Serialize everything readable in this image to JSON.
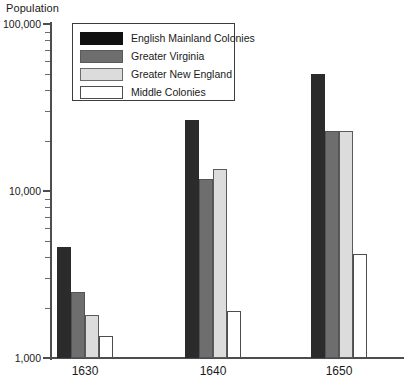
{
  "chart_data": {
    "type": "bar",
    "title": "",
    "xlabel": "",
    "ylabel": "Population",
    "yscale": "log",
    "ylim": [
      1000,
      100000
    ],
    "ytick_labels": [
      "100,000",
      "10,000",
      "1,000"
    ],
    "grid": false,
    "legend_position": "top-left inside",
    "categories": [
      "1630",
      "1640",
      "1650"
    ],
    "series": [
      {
        "name": "English Mainland Colonies",
        "color": "#2b2b2b",
        "values": [
          4600,
          26500,
          50000
        ]
      },
      {
        "name": "Greater Virginia",
        "color": "#6e6e6e",
        "values": [
          2500,
          11800,
          23000
        ]
      },
      {
        "name": "Greater New England",
        "color": "#dcdcdc",
        "values": [
          1800,
          13500,
          23000
        ]
      },
      {
        "name": "Middle Colonies",
        "color": "#ffffff",
        "values": [
          1350,
          1900,
          4200
        ]
      }
    ]
  },
  "axis": {
    "y_title": "Population",
    "y_labels": [
      "100,000",
      "10,000",
      "1,000"
    ],
    "x_labels": [
      "1630",
      "1640",
      "1650"
    ]
  },
  "legend": {
    "entries": [
      {
        "label": "English Mainland Colonies"
      },
      {
        "label": "Greater Virginia"
      },
      {
        "label": "Greater New England"
      },
      {
        "label": "Middle Colonies"
      }
    ]
  }
}
